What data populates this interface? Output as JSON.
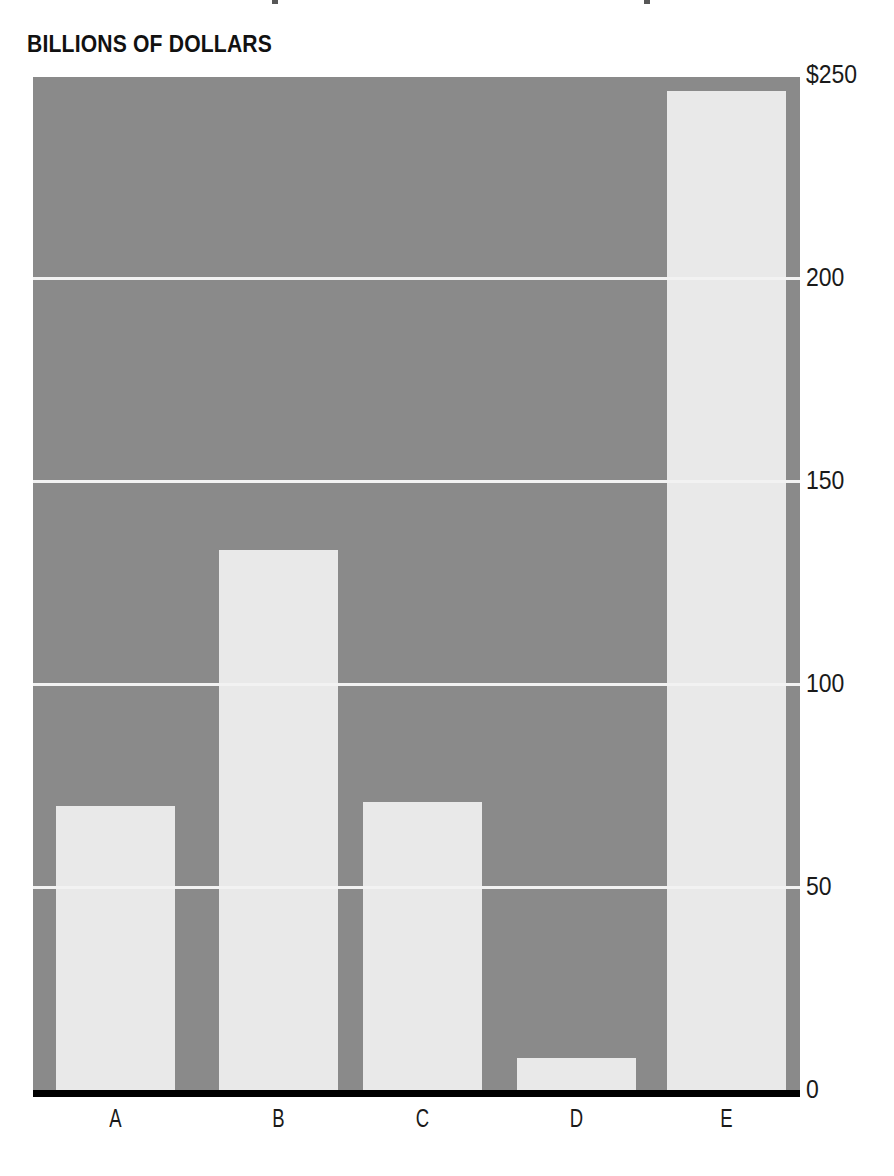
{
  "chart_data": {
    "type": "bar",
    "title": "BILLIONS OF DOLLARS",
    "xlabel": "",
    "ylabel": "",
    "categories": [
      "A",
      "B",
      "C",
      "D",
      "E"
    ],
    "values": [
      70,
      133,
      71,
      8,
      246
    ],
    "ylim": [
      0,
      250
    ],
    "yticks": [
      0,
      50,
      100,
      150,
      200,
      250
    ],
    "ytick_labels": [
      "0",
      "50",
      "100",
      "150",
      "200",
      "$250"
    ],
    "grid": true,
    "gridlines_at": [
      50,
      100,
      150,
      200
    ],
    "legend": null,
    "legend_position": "none",
    "series": [
      {
        "name": "Billions of dollars",
        "values": [
          70,
          133,
          71,
          8,
          246
        ]
      }
    ],
    "colors": {
      "bar": "#e9e9e9",
      "plot_background": "#8a8a8a",
      "gridline": "#f2f2f2",
      "baseline": "#000000",
      "text": "#1a1a1a",
      "title": "#111111",
      "page_background": "#ffffff"
    }
  }
}
